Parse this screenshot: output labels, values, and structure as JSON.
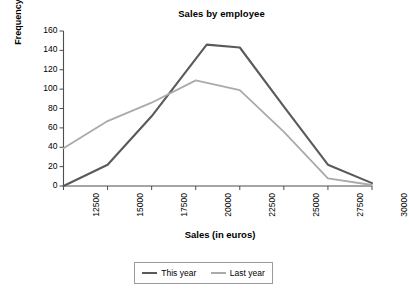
{
  "chart_data": {
    "type": "line",
    "title": "Sales by employee",
    "xlabel": "Sales (in euros)",
    "ylabel": "Frequency",
    "categories": [
      "12500",
      "15000",
      "17500",
      "20000",
      "22500",
      "25000",
      "27500",
      "30000"
    ],
    "x": [
      12500,
      15000,
      17500,
      20000,
      22500,
      25000,
      27500,
      30000
    ],
    "series": [
      {
        "name": "This year",
        "color": "#5a5a5a",
        "values": [
          0,
          22,
          72,
          146,
          143,
          82,
          22,
          3
        ]
      },
      {
        "name": "Last year",
        "color": "#aaaaaa",
        "values": [
          39,
          67,
          86,
          109,
          99,
          56,
          8,
          1
        ]
      }
    ],
    "xlim": [
      12500,
      30000
    ],
    "ylim": [
      0,
      160
    ],
    "yticks": [
      "160",
      "140",
      "120",
      "100",
      "80",
      "60",
      "40",
      "20",
      "0"
    ],
    "ytick_values": [
      160,
      140,
      120,
      100,
      80,
      60,
      40,
      20,
      0
    ],
    "grid": false,
    "legend_position": "bottom",
    "peak_marker_x": 20625,
    "peak_marker_y": 146
  },
  "legend": {
    "entries": [
      {
        "label": "This year",
        "color": "#5a5a5a"
      },
      {
        "label": "Last year",
        "color": "#aaaaaa"
      }
    ]
  },
  "colors": {
    "this_year": "#5a5a5a",
    "last_year": "#aaaaaa",
    "axis": "#4d4d4d",
    "legend_border": "#9a9a9a"
  }
}
